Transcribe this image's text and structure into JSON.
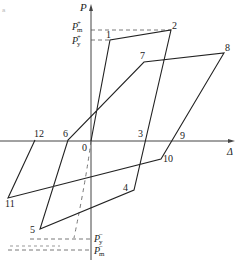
{
  "figure": {
    "corner_mark": "a",
    "axes": {
      "y_label": "P",
      "x_label": "Δ",
      "origin_label": "0"
    },
    "levels": {
      "pm_plus": {
        "symbol": "P",
        "sup": "+",
        "sub": "m"
      },
      "py_plus": {
        "symbol": "P",
        "sup": "+",
        "sub": "y"
      },
      "py_minus": {
        "symbol": "P",
        "sup": "−",
        "sub": "y"
      },
      "pm_minus": {
        "symbol": "P",
        "sup": "−",
        "sub": "m"
      }
    },
    "points": [
      {
        "id": "1",
        "x": 110,
        "y": 40
      },
      {
        "id": "2",
        "x": 171,
        "y": 30
      },
      {
        "id": "3",
        "x": 146,
        "y": 140
      },
      {
        "id": "4",
        "x": 134,
        "y": 190
      },
      {
        "id": "5",
        "x": 40,
        "y": 229
      },
      {
        "id": "6",
        "x": 68,
        "y": 140
      },
      {
        "id": "7",
        "x": 144,
        "y": 62
      },
      {
        "id": "8",
        "x": 224,
        "y": 53
      },
      {
        "id": "9",
        "x": 177,
        "y": 140
      },
      {
        "id": "10",
        "x": 161,
        "y": 159
      },
      {
        "id": "11",
        "x": 8,
        "y": 198
      },
      {
        "id": "12",
        "x": 35,
        "y": 140
      }
    ],
    "colors": {
      "line": "#222222",
      "axis": "#444444",
      "dash": "#555555"
    }
  }
}
